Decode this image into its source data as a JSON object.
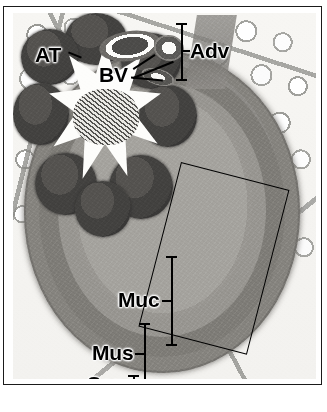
{
  "figure": {
    "type": "histology-micrograph",
    "staining": "grayscale (H&E printed in black and white)",
    "frame": {
      "border_color": "#1a1a1a",
      "background": "#ffffff"
    }
  },
  "labels": [
    {
      "key": "at",
      "text": "AT",
      "meaning": "adipose tissue",
      "marker": "leader-line",
      "position": {
        "x": 22,
        "y": 30
      }
    },
    {
      "key": "bv",
      "text": "BV",
      "meaning": "blood vessels",
      "marker": "three-leader-lines",
      "position": {
        "x": 88,
        "y": 58
      }
    },
    {
      "key": "adv",
      "text": "Adv",
      "meaning": "adventitia",
      "marker": "vertical-bracket-left",
      "position": {
        "x": 190,
        "y": 34
      }
    },
    {
      "key": "muc",
      "text": "Muc",
      "meaning": "mucosa",
      "marker": "vertical-bracket-right",
      "position": {
        "x": 118,
        "y": 288
      }
    },
    {
      "key": "mus",
      "text": "Mus",
      "meaning": "muscularis",
      "marker": "vertical-bracket-right",
      "position": {
        "x": 93,
        "y": 341
      }
    },
    {
      "key": "ser",
      "text": "Ser",
      "meaning": "serosa",
      "marker": "short-vertical-bracket-right",
      "position": {
        "x": 88,
        "y": 374
      }
    }
  ],
  "roi": {
    "name": "region-of-interest-box",
    "shape": "rectangle",
    "rotation_deg": 14.5,
    "stroke": "#000000",
    "corners": [
      {
        "x": 199,
        "y": 158
      },
      {
        "x": 307,
        "y": 172
      },
      {
        "x": 287,
        "y": 343
      },
      {
        "x": 176,
        "y": 325
      }
    ]
  },
  "colors": {
    "ink": "#000000",
    "frame": "#1a1a1a",
    "page": "#ffffff",
    "tissue_dark": "#3a3938",
    "tissue_mid": "#8b8984",
    "tissue_light": "#f3f2ef"
  }
}
